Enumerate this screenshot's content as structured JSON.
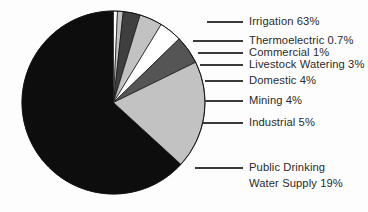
{
  "chart_data": {
    "type": "pie",
    "title": "",
    "subtitle": "",
    "xlabel": "",
    "ylabel": "",
    "legend_position": "callout-labels-right",
    "grid": false,
    "units": "percent",
    "total": 99.7,
    "categories": [
      "Irrigation",
      "Thermoelectric",
      "Commercial",
      "Livestock Watering",
      "Domestic",
      "Mining",
      "Industrial",
      "Public Drinking Water Supply"
    ],
    "values": [
      63,
      0.7,
      1,
      3,
      4,
      4,
      5,
      19
    ],
    "value_labels": [
      "63%",
      "0.7%",
      "1%",
      "3%",
      "4%",
      "4%",
      "5%",
      "19%"
    ],
    "slices": [
      {
        "name": "irrigation",
        "label": "Irrigation 63%",
        "category": "Irrigation",
        "value": 63,
        "value_label": "63%",
        "color": "#0d0d0d"
      },
      {
        "name": "thermoelectric",
        "label": "Thermoelectric 0.7%",
        "category": "Thermoelectric",
        "value": 0.7,
        "value_label": "0.7%",
        "color": "#ffffff"
      },
      {
        "name": "commercial",
        "label": "Commercial 1%",
        "category": "Commercial",
        "value": 1,
        "value_label": "1%",
        "color": "#c2c2c2"
      },
      {
        "name": "livestock-watering",
        "label": "Livestock Watering 3%",
        "category": "Livestock Watering",
        "value": 3,
        "value_label": "3%",
        "color": "#3f3f3f"
      },
      {
        "name": "domestic",
        "label": "Domestic 4%",
        "category": "Domestic",
        "value": 4,
        "value_label": "4%",
        "color": "#c2c2c2"
      },
      {
        "name": "mining",
        "label": "Mining 4%",
        "category": "Mining",
        "value": 4,
        "value_label": "4%",
        "color": "#ffffff"
      },
      {
        "name": "industrial",
        "label": "Industrial 5%",
        "category": "Industrial",
        "value": 5,
        "value_label": "5%",
        "color": "#555555"
      },
      {
        "name": "public-drinking-water-supply",
        "label": "Public Drinking Water Supply 19%",
        "category": "Public Drinking Water Supply",
        "value": 19,
        "value_label": "19%",
        "color": "#c2c2c2",
        "label_line_1": "Public Drinking",
        "label_line_2": "Water Supply 19%"
      }
    ]
  },
  "callouts": {
    "irrigation": "Irrigation 63%",
    "thermoelectric": "Thermoelectric 0.7%",
    "commercial": "Commercial 1%",
    "livestock": "Livestock Watering 3%",
    "domestic": "Domestic 4%",
    "mining": "Mining 4%",
    "industrial": "Industrial 5%",
    "public_line1": "Public Drinking",
    "public_line2": "Water Supply 19%"
  },
  "colors": {
    "black": "#0d0d0d",
    "dark_gray": "#3f3f3f",
    "mid_gray": "#555555",
    "light_gray": "#c2c2c2",
    "white": "#ffffff",
    "text": "#2b2b2b",
    "leader": "#3a3a3a",
    "background": "#fdfdfd"
  }
}
